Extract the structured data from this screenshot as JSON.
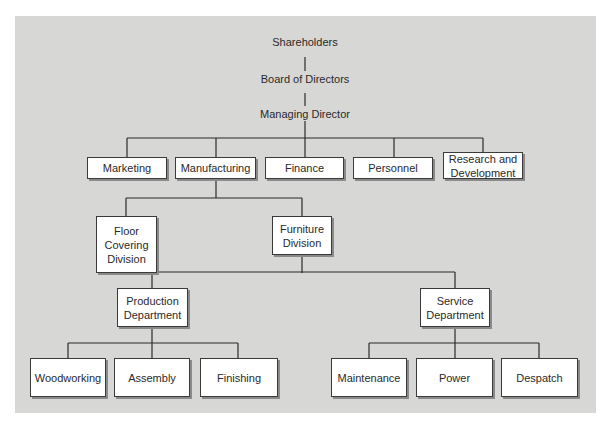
{
  "diagram": {
    "type": "organization-chart",
    "background_color": "#d7d7d5",
    "line_color": "#2a2a2a",
    "top_chain": [
      "Shareholders",
      "Board of Directors",
      "Managing Director"
    ],
    "functions": [
      "Marketing",
      "Manufacturing",
      "Finance",
      "Personnel",
      "Research and Development"
    ],
    "manufacturing_divisions": [
      "Floor Covering Division",
      "Furniture Division"
    ],
    "furniture_departments": [
      "Production Department",
      "Service Department"
    ],
    "production_sections": [
      "Woodworking",
      "Assembly",
      "Finishing"
    ],
    "service_sections": [
      "Maintenance",
      "Power",
      "Despatch"
    ]
  }
}
